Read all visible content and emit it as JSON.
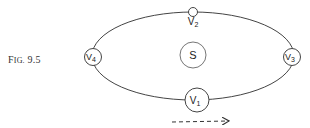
{
  "figure": {
    "caption_prefix": "F",
    "caption_smallcaps": "IG.",
    "caption_number": " 9.5"
  },
  "diagram": {
    "orbit": {
      "shape": "ellipse",
      "stroke": "#444444"
    },
    "sun": {
      "label": "S"
    },
    "positions": [
      {
        "id": "v1",
        "label": "V",
        "subscript": "1",
        "location": "bottom"
      },
      {
        "id": "v2",
        "label": "V",
        "subscript": "2",
        "location": "top"
      },
      {
        "id": "v3",
        "label": "V",
        "subscript": "3",
        "location": "right"
      },
      {
        "id": "v4",
        "label": "V",
        "subscript": "4",
        "location": "left"
      }
    ],
    "direction_arrow": {
      "style": "dashed",
      "direction": "right"
    }
  }
}
